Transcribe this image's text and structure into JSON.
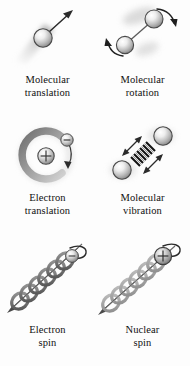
{
  "figure": {
    "background_color": "#fdfdfd",
    "text_color": "#0f0f0f",
    "sphere_light": "#f2f2f2",
    "sphere_mid": "#b8b8b8",
    "sphere_dark": "#6e6e6e",
    "outline_color": "#3a3a3a",
    "shadow_color": "#c9c9c9",
    "spring_color": "#1c1c1c",
    "orbital_color": "#8a8a8a",
    "helix_color": "#6a6a6a"
  },
  "panels": [
    {
      "id": "molecular-translation",
      "line1": "Molecular",
      "line2": "translation",
      "icon": "sphere-with-motion-trail-and-arrow",
      "elements": [
        "sphere",
        "motion-blur-trail",
        "straight-arrow"
      ]
    },
    {
      "id": "molecular-rotation",
      "line1": "Molecular",
      "line2": "rotation",
      "icon": "two-spheres-bonded-with-curved-rotation-arrows",
      "elements": [
        "sphere",
        "sphere",
        "bond",
        "curved-arrow",
        "curved-arrow"
      ]
    },
    {
      "id": "electron-translation",
      "line1": "Electron",
      "line2": "translation",
      "icon": "nucleus-with-orbiting-electron",
      "elements": [
        "nucleus-plus",
        "orbital-arc",
        "electron-minus",
        "arrow"
      ],
      "nucleus_charge": "+",
      "electron_charge": "−"
    },
    {
      "id": "molecular-vibration",
      "line1": "Molecular",
      "line2": "vibration",
      "icon": "two-spheres-with-spring-and-vibration-arrows",
      "elements": [
        "sphere",
        "sphere",
        "spring-coil",
        "double-arrow",
        "double-arrow"
      ]
    },
    {
      "id": "electron-spin",
      "line1": "Electron",
      "line2": "spin",
      "icon": "helix-with-electron-and-spin-axis",
      "elements": [
        "helix",
        "spin-axis",
        "curved-spin-arrow",
        "electron-sphere"
      ]
    },
    {
      "id": "nuclear-spin",
      "line1": "Nuclear",
      "line2": "spin",
      "icon": "helix-with-nucleus-and-spin-axis",
      "elements": [
        "helix",
        "spin-axis",
        "curved-spin-arrow",
        "nucleus-plus"
      ],
      "nucleus_charge": "+"
    }
  ]
}
